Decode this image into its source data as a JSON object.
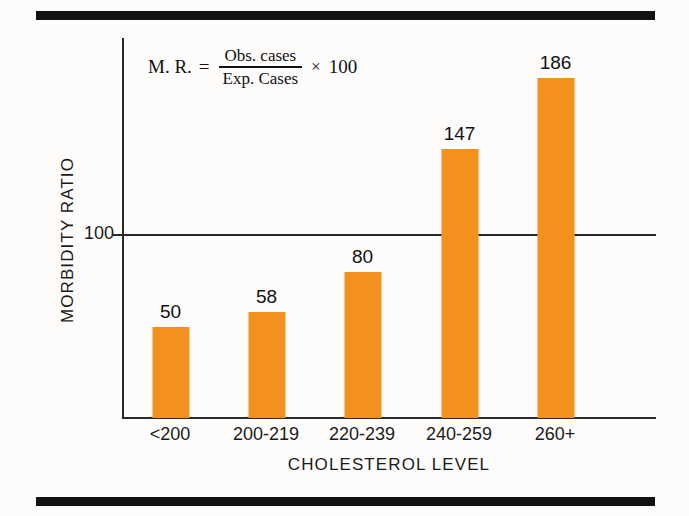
{
  "chart_data": {
    "type": "bar",
    "title": "",
    "subtitle": "",
    "xlabel": "CHOLESTEROL LEVEL",
    "ylabel": "MORBIDITY RATIO",
    "categories": [
      "<200",
      "200-219",
      "220-239",
      "240-259",
      "260+"
    ],
    "values": [
      50,
      58,
      80,
      147,
      186
    ],
    "series": [
      {
        "name": "Morbidity ratio",
        "values": [
          50,
          58,
          80,
          147,
          186
        ]
      }
    ],
    "ylim": [
      0,
      208
    ],
    "yticks": [
      100
    ],
    "ytick_labels": [
      "100"
    ],
    "grid": false,
    "legend": "none",
    "reference_line": {
      "value": 100,
      "label": "100"
    },
    "bar_color": "#f4901e",
    "annotations": [
      {
        "name": "morbidity-ratio-formula",
        "lhs": "M. R.",
        "equals": "=",
        "numerator": "Obs. cases",
        "denominator": "Exp. Cases",
        "times": "×",
        "multiplier": "100"
      }
    ]
  },
  "axes": {
    "y": {
      "title": "MORBIDITY RATIO",
      "ticks": [
        {
          "label": "100"
        }
      ]
    },
    "x": {
      "title": "CHOLESTEROL LEVEL",
      "ticks": [
        {
          "label": "<200"
        },
        {
          "label": "200-219"
        },
        {
          "label": "220-239"
        },
        {
          "label": "240-259"
        },
        {
          "label": "260+"
        }
      ]
    }
  },
  "bars": [
    {
      "category": "<200",
      "value": 50,
      "value_label": "50"
    },
    {
      "category": "200-219",
      "value": 58,
      "value_label": "58"
    },
    {
      "category": "220-239",
      "value": 80,
      "value_label": "80"
    },
    {
      "category": "240-259",
      "value": 147,
      "value_label": "147"
    },
    {
      "category": "260+",
      "value": 186,
      "value_label": "186"
    }
  ],
  "formula": {
    "lhs": "M. R.",
    "equals": "=",
    "numerator": "Obs. cases",
    "denominator": "Exp. Cases",
    "times": "×",
    "multiplier": "100"
  },
  "colors": {
    "bar": "#f4901e",
    "ink": "#1b1b1b",
    "rule": "#121212",
    "background": "#fdfcfa"
  }
}
